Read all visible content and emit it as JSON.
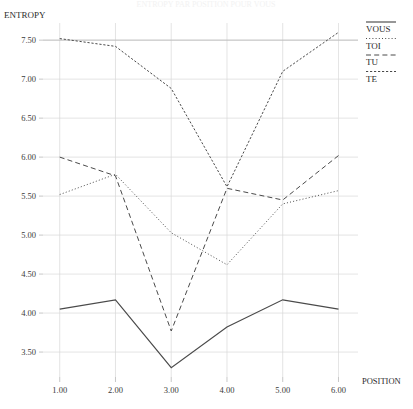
{
  "title": "ENTROPY PAR POSITION POUR VOUS",
  "y_axis_label": "ENTROPY",
  "x_axis_label": "POSITION",
  "legend": {
    "items": [
      {
        "label": "VOUS",
        "style": "solid"
      },
      {
        "label": "TOI",
        "style": "dotted"
      },
      {
        "label": "TU",
        "style": "dashed"
      },
      {
        "label": "TE",
        "style": "longdash"
      }
    ]
  },
  "chart_data": {
    "type": "line",
    "title": "ENTROPY PAR POSITION POUR VOUS",
    "xlabel": "POSITION",
    "ylabel": "ENTROPY",
    "x": [
      1,
      2,
      3,
      4,
      5,
      6
    ],
    "xtick_labels": [
      "1.00",
      "2.00",
      "3.00",
      "4.00",
      "5.00",
      "6.00"
    ],
    "ytick_labels": [
      "3.50",
      "4.00",
      "4.50",
      "5.00",
      "5.50",
      "6.00",
      "6.50",
      "7.00",
      "7.50"
    ],
    "ytick_values": [
      3.5,
      4.0,
      4.5,
      5.0,
      5.5,
      6.0,
      6.5,
      7.0,
      7.5
    ],
    "xlim": [
      0.7,
      6.35
    ],
    "ylim": [
      3.18,
      7.72
    ],
    "grid": true,
    "legend_position": "top-right-outside",
    "series": [
      {
        "name": "VOUS",
        "style": "solid",
        "values": [
          4.05,
          4.17,
          3.3,
          3.82,
          4.17,
          4.05
        ]
      },
      {
        "name": "TOI",
        "style": "dotted",
        "values": [
          5.52,
          5.78,
          5.03,
          4.62,
          5.4,
          5.57
        ]
      },
      {
        "name": "TU",
        "style": "dashed",
        "values": [
          6.0,
          5.76,
          3.77,
          5.6,
          5.45,
          6.02
        ]
      },
      {
        "name": "TE",
        "style": "longdash",
        "values": [
          7.52,
          7.42,
          6.88,
          5.62,
          7.1,
          7.6
        ]
      }
    ]
  }
}
